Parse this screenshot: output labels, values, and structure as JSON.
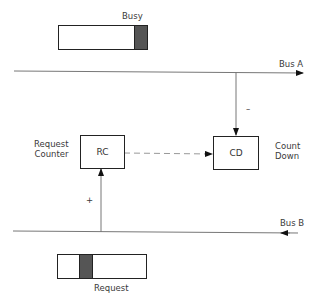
{
  "labels": {
    "busy": "Busy",
    "bus_a": "Bus A",
    "bus_b": "Bus B",
    "request": "Request",
    "request_counter_line1": "Request",
    "request_counter_line2": "Counter",
    "count_down_line1": "Count",
    "count_down_line2": "Down",
    "minus": "–",
    "plus": "+"
  },
  "nodes": {
    "rc": {
      "label": "RC"
    },
    "cd": {
      "label": "CD"
    }
  },
  "colors": {
    "line": "#777777",
    "box_border": "#222222",
    "shade": "#555555"
  }
}
